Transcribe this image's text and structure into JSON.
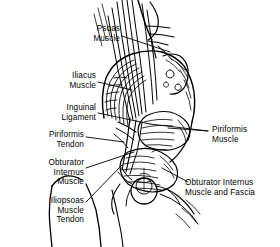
{
  "figure": {
    "background_color": "#ffffff",
    "ink_color": "#000000",
    "width": 280,
    "height": 247
  },
  "labels": [
    {
      "id": "psoas-muscle",
      "text": "Psoas\nMuscle",
      "align": "right",
      "x": 68,
      "y": 24,
      "width": 52
    },
    {
      "id": "iliacus-muscle",
      "text": "Iliacus\nMuscle",
      "align": "right",
      "x": 44,
      "y": 71,
      "width": 52
    },
    {
      "id": "inguinal-ligament",
      "text": "Inguinal\nLigament",
      "align": "right",
      "x": 22,
      "y": 103,
      "width": 74
    },
    {
      "id": "piriformis-tendon",
      "text": "Piriformis\nTendon",
      "align": "right",
      "x": 14,
      "y": 130,
      "width": 70
    },
    {
      "id": "obturator-internus-muscle",
      "text": "Obturator\nInternus\nMuscle",
      "align": "right",
      "x": 14,
      "y": 158,
      "width": 70
    },
    {
      "id": "iliopsoas-muscle-tendon",
      "text": "Iliopsoas\nMuscle\nTendon",
      "align": "right",
      "x": 14,
      "y": 196,
      "width": 70
    },
    {
      "id": "piriformis-muscle",
      "text": "Piriformis\nMuscle",
      "align": "left",
      "x": 212,
      "y": 125,
      "width": 66
    },
    {
      "id": "obturator-internus-muscle-and-fascia",
      "text": "Obturator Internus\nMuscle and Fascia",
      "align": "left",
      "x": 185,
      "y": 178,
      "width": 95
    }
  ]
}
